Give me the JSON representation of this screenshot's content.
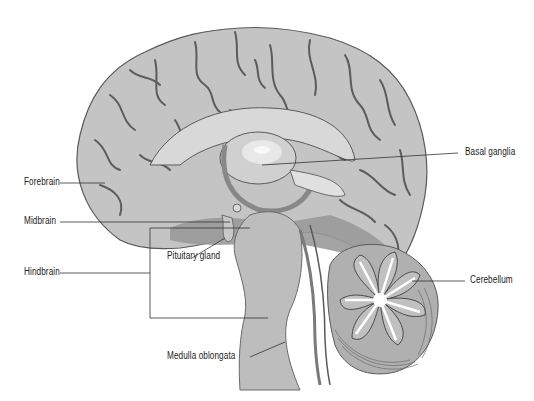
{
  "diagram": {
    "labels": {
      "forebrain": "Forebrain",
      "midbrain": "Midbrain",
      "hindbrain": "Hindbrain",
      "pituitary": "Pituitary gland",
      "medulla": "Medulla oblongata",
      "basal_ganglia": "Basal ganglia",
      "cerebellum": "Cerebellum"
    },
    "colors": {
      "background": "#ffffff",
      "cortex": "#c4c4c4",
      "cortex_shadow": "#a8a8a8",
      "sulcus": "#4a4a4a",
      "outline": "#5a5a5a",
      "inner_light": "#d8d8d8",
      "inner_dark": "#9a9a9a",
      "brainstem": "#bdbdbd",
      "cerebellum": "#b0b0b0",
      "leader_line": "#333333"
    }
  }
}
